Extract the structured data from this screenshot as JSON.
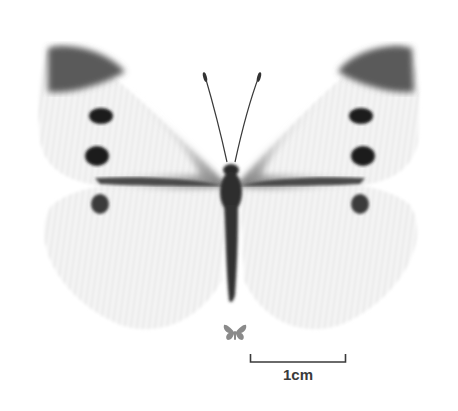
{
  "figure": {
    "colors": {
      "background": "#ffffff",
      "wing_base": "#f3f3f3",
      "wing_tip": "#555555",
      "spots": "#1e1e1e",
      "body": "#2a2a2a",
      "scale": "#3a3a3a",
      "life_size_icon": "#8a8a8a"
    }
  },
  "scale_bar": {
    "label": "1cm"
  },
  "life_size_icon": {
    "name": "butterfly-icon"
  }
}
